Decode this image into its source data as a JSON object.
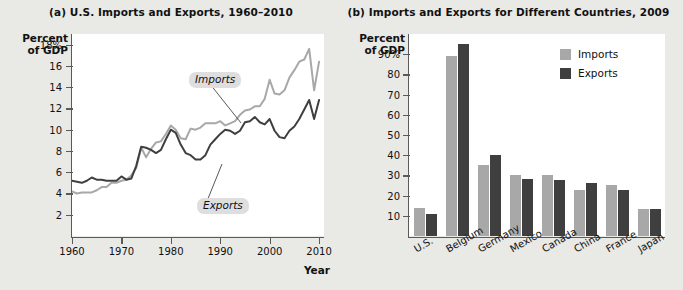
{
  "figure": {
    "background_color": "#e9e9e6",
    "plot_background_color": "#ffffff",
    "axis_color": "#5a5a5a",
    "imports_color": "#a8a8a8",
    "exports_color": "#3f3f3f"
  },
  "panel_a": {
    "title": "(a) U.S. Imports and Exports, 1960–2010",
    "axis_caption": "Percent\nof GDP",
    "xlabel": "Year",
    "ytick_labels": [
      "18%",
      "16",
      "14",
      "12",
      "10",
      "8",
      "6",
      "4",
      "2"
    ],
    "xtick_labels": [
      "1960",
      "1970",
      "1980",
      "1990",
      "2000",
      "2010"
    ],
    "callout_imports": "Imports",
    "callout_exports": "Exports"
  },
  "panel_b": {
    "title": "(b) Imports and Exports for Different Countries, 2009",
    "axis_caption": "Percent\nof GDP",
    "ytick_labels": [
      "90%",
      "80",
      "70",
      "60",
      "50",
      "40",
      "30",
      "20",
      "10"
    ],
    "legend": [
      {
        "label": "Imports",
        "color": "#a8a8a8"
      },
      {
        "label": "Exports",
        "color": "#3f3f3f"
      }
    ]
  },
  "chart_data": [
    {
      "type": "line",
      "title": "(a) U.S. Imports and Exports, 1960–2010",
      "xlabel": "Year",
      "ylabel": "Percent of GDP",
      "xlim": [
        1960,
        2011
      ],
      "ylim": [
        0,
        19
      ],
      "yticks": [
        2,
        4,
        6,
        8,
        10,
        12,
        14,
        16,
        18
      ],
      "xticks": [
        1960,
        1970,
        1980,
        1990,
        2000,
        2010
      ],
      "grid": false,
      "annotations": [
        "Imports",
        "Exports"
      ],
      "x": [
        1960,
        1961,
        1962,
        1963,
        1964,
        1965,
        1966,
        1967,
        1968,
        1969,
        1970,
        1971,
        1972,
        1973,
        1974,
        1975,
        1976,
        1977,
        1978,
        1979,
        1980,
        1981,
        1982,
        1983,
        1984,
        1985,
        1986,
        1987,
        1988,
        1989,
        1990,
        1991,
        1992,
        1993,
        1994,
        1995,
        1996,
        1997,
        1998,
        1999,
        2000,
        2001,
        2002,
        2003,
        2004,
        2005,
        2006,
        2007,
        2008,
        2009,
        2010
      ],
      "series": [
        {
          "name": "Imports",
          "color": "#a8a8a8",
          "values": [
            4.2,
            4.0,
            4.1,
            4.1,
            4.1,
            4.3,
            4.6,
            4.6,
            5.0,
            5.0,
            5.2,
            5.3,
            5.7,
            6.4,
            8.3,
            7.4,
            8.2,
            8.8,
            8.9,
            9.6,
            10.4,
            10.0,
            9.2,
            9.1,
            10.1,
            10.0,
            10.2,
            10.6,
            10.6,
            10.6,
            10.8,
            10.4,
            10.6,
            10.8,
            11.4,
            11.8,
            11.9,
            12.2,
            12.2,
            12.9,
            14.7,
            13.4,
            13.3,
            13.7,
            14.9,
            15.6,
            16.4,
            16.6,
            17.6,
            13.7,
            16.4
          ]
        },
        {
          "name": "Exports",
          "color": "#3f3f3f",
          "values": [
            5.2,
            5.1,
            5.0,
            5.2,
            5.5,
            5.3,
            5.3,
            5.2,
            5.2,
            5.2,
            5.6,
            5.3,
            5.4,
            6.6,
            8.4,
            8.3,
            8.1,
            7.8,
            8.1,
            9.1,
            10.0,
            9.7,
            8.6,
            7.8,
            7.6,
            7.2,
            7.2,
            7.6,
            8.6,
            9.1,
            9.6,
            10.0,
            9.9,
            9.6,
            9.9,
            10.7,
            10.8,
            11.2,
            10.7,
            10.5,
            11.0,
            9.9,
            9.3,
            9.2,
            9.9,
            10.3,
            11.0,
            11.9,
            12.8,
            11.0,
            12.8
          ]
        }
      ]
    },
    {
      "type": "bar",
      "title": "(b) Imports and Exports for Different Countries, 2009",
      "xlabel": "",
      "ylabel": "Percent of GDP",
      "ylim": [
        0,
        100
      ],
      "yticks": [
        10,
        20,
        30,
        40,
        50,
        60,
        70,
        80,
        90
      ],
      "grid": false,
      "legend_position": "top-right",
      "categories": [
        "U.S.",
        "Belgium",
        "Germany",
        "Mexico",
        "Canada",
        "China",
        "France",
        "Japan"
      ],
      "series": [
        {
          "name": "Imports",
          "color": "#a8a8a8",
          "values": [
            14,
            89,
            35,
            30,
            30,
            23,
            25.5,
            13.5
          ]
        },
        {
          "name": "Exports",
          "color": "#3f3f3f",
          "values": [
            11,
            95,
            40,
            28,
            27.5,
            26,
            23,
            13.5
          ]
        }
      ]
    }
  ]
}
